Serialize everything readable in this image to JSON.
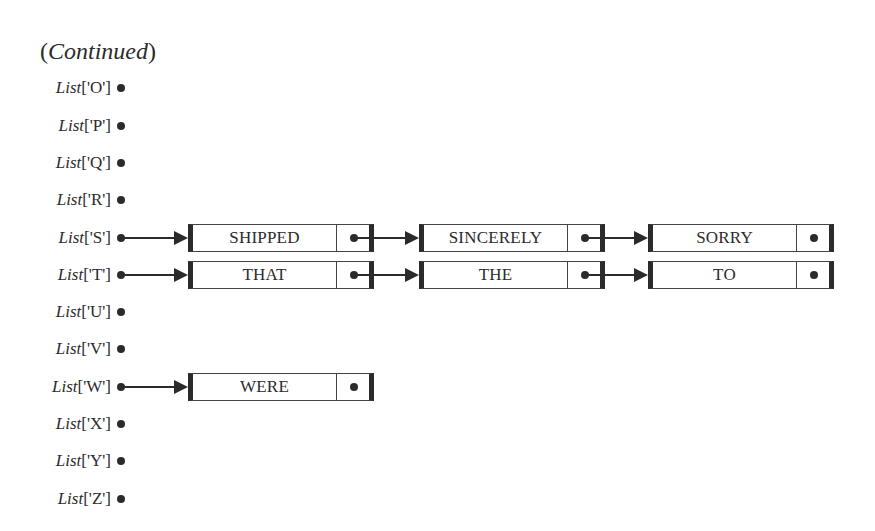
{
  "title": {
    "open_paren": "(",
    "word": "Continued",
    "close_paren": ")"
  },
  "colors": {
    "ink": "#2b2b2b",
    "background": "#ffffff"
  },
  "rows": [
    {
      "key": "O",
      "prefix": "List",
      "index": "['O']",
      "nodes": []
    },
    {
      "key": "P",
      "prefix": "List",
      "index": "['P']",
      "nodes": []
    },
    {
      "key": "Q",
      "prefix": "List",
      "index": "['Q']",
      "nodes": []
    },
    {
      "key": "R",
      "prefix": "List",
      "index": "['R']",
      "nodes": []
    },
    {
      "key": "S",
      "prefix": "List",
      "index": "['S']",
      "nodes": [
        "SHIPPED",
        "SINCERELY",
        "SORRY"
      ]
    },
    {
      "key": "T",
      "prefix": "List",
      "index": "['T']",
      "nodes": [
        "THAT",
        "THE",
        "TO"
      ]
    },
    {
      "key": "U",
      "prefix": "List",
      "index": "['U']",
      "nodes": []
    },
    {
      "key": "V",
      "prefix": "List",
      "index": "['V']",
      "nodes": []
    },
    {
      "key": "W",
      "prefix": "List",
      "index": "['W']",
      "nodes": [
        "WERE"
      ]
    },
    {
      "key": "X",
      "prefix": "List",
      "index": "['X']",
      "nodes": []
    },
    {
      "key": "Y",
      "prefix": "List",
      "index": "['Y']",
      "nodes": []
    },
    {
      "key": "Z",
      "prefix": "List",
      "index": "['Z']",
      "nodes": []
    }
  ]
}
